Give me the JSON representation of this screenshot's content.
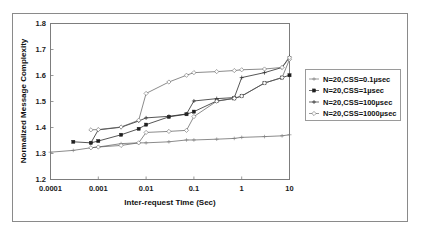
{
  "chart_data": {
    "type": "line",
    "title": "",
    "xlabel": "Inter-request Time (Sec)",
    "ylabel": "Normalized Message Complexity",
    "xscale": "log",
    "yscale": "linear",
    "xlim": [
      0.0001,
      10
    ],
    "ylim": [
      1.2,
      1.8
    ],
    "xticks": [
      0.0001,
      0.001,
      0.01,
      0.1,
      1,
      10
    ],
    "xtick_labels": [
      "0.0001",
      "0.001",
      "0.01",
      "0.1",
      "1",
      "10"
    ],
    "yticks": [
      1.2,
      1.3,
      1.4,
      1.5,
      1.6,
      1.7,
      1.8
    ],
    "ytick_labels": [
      "1.2",
      "1.3",
      "1.4",
      "1.5",
      "1.6",
      "1.7",
      "1.8"
    ],
    "grid": false,
    "legend_position": "right-outside",
    "series": [
      {
        "name": "N=20,CSS=0.1µsec",
        "marker": "plus",
        "x": [
          0.0001,
          0.0003,
          0.0007,
          0.001,
          0.003,
          0.007,
          0.01,
          0.03,
          0.07,
          0.1,
          0.3,
          0.7,
          1,
          3,
          7,
          10
        ],
        "y": [
          1.305,
          1.312,
          1.322,
          1.325,
          1.338,
          1.341,
          1.341,
          1.345,
          1.352,
          1.352,
          1.355,
          1.358,
          1.362,
          1.365,
          1.368,
          1.372
        ]
      },
      {
        "name": "N=20,CSS=1µsec",
        "marker": "filled-square",
        "x": [
          0.0003,
          0.0007,
          0.001,
          0.003,
          0.007,
          0.01,
          0.03,
          0.07,
          0.1,
          0.3,
          0.7,
          1,
          3,
          7,
          10
        ],
        "y": [
          1.345,
          1.341,
          1.348,
          1.372,
          1.395,
          1.411,
          1.441,
          1.451,
          1.461,
          1.502,
          1.512,
          1.521,
          1.571,
          1.592,
          1.601
        ]
      },
      {
        "name": "N=20,CSS=100µsec",
        "marker": "plus-dark",
        "x": [
          0.0007,
          0.001,
          0.003,
          0.007,
          0.01,
          0.03,
          0.07,
          0.1,
          0.3,
          0.7,
          1,
          3,
          7,
          10
        ],
        "y": [
          1.341,
          1.391,
          1.401,
          1.425,
          1.437,
          1.443,
          1.452,
          1.502,
          1.511,
          1.515,
          1.592,
          1.611,
          1.631,
          1.672
        ]
      },
      {
        "name": "N=20,CSS=1000µsec",
        "marker": "open-diamond",
        "x": [
          0.0007,
          0.001,
          0.003,
          0.007,
          0.01,
          0.03,
          0.07,
          0.1,
          0.3,
          0.7,
          1,
          3,
          7,
          10
        ],
        "y": [
          1.322,
          1.325,
          1.331,
          1.341,
          1.381,
          1.385,
          1.389,
          1.442,
          1.501,
          1.512,
          1.521,
          1.571,
          1.592,
          1.662
        ]
      },
      {
        "name": "N=20,CSS=1000µsec-upper",
        "marker": "open-diamond",
        "x": [
          0.0007,
          0.001,
          0.003,
          0.007,
          0.01,
          0.03,
          0.07,
          0.1,
          0.3,
          0.7,
          1,
          3,
          7,
          10
        ],
        "y": [
          1.391,
          1.392,
          1.402,
          1.428,
          1.531,
          1.575,
          1.601,
          1.611,
          1.615,
          1.619,
          1.622,
          1.625,
          1.631,
          1.668
        ]
      }
    ],
    "legend_entries": [
      "N=20,CSS=0.1µsec",
      "N=20,CSS=1µsec",
      "N=20,CSS=100µsec",
      "N=20,CSS=1000µsec"
    ]
  },
  "colors": {
    "line": "#595959",
    "line_dark": "#2b2b2b",
    "frame": "#7d7d7d",
    "outer_frame": "#8a8a8a",
    "text": "#111111",
    "background": "#ffffff"
  }
}
